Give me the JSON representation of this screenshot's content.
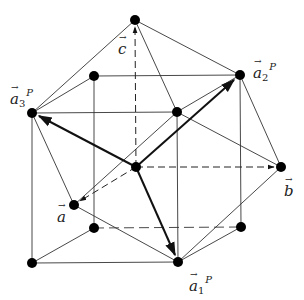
{
  "diagram": {
    "type": "crystal-lattice-vectors",
    "colors": {
      "line": "#333333",
      "point": "#000000",
      "background": "#ffffff"
    },
    "labels": {
      "c": {
        "base": "c",
        "sub": "",
        "sup": ""
      },
      "a": {
        "base": "a",
        "sub": "",
        "sup": ""
      },
      "b": {
        "base": "b",
        "sub": "",
        "sup": ""
      },
      "a1P": {
        "base": "a",
        "sub": "1",
        "sup": "P"
      },
      "a2P": {
        "base": "a",
        "sub": "2",
        "sup": "P"
      },
      "a3P": {
        "base": "a",
        "sub": "3",
        "sup": "P"
      }
    },
    "points": [
      {
        "id": "apex-top",
        "x": 135,
        "y": 20
      },
      {
        "id": "a3P",
        "x": 32,
        "y": 113
      },
      {
        "id": "back-top-left",
        "x": 94,
        "y": 76
      },
      {
        "id": "a2P",
        "x": 240,
        "y": 75
      },
      {
        "id": "front-top-right",
        "x": 177,
        "y": 112
      },
      {
        "id": "center",
        "x": 136,
        "y": 167
      },
      {
        "id": "a-tip",
        "x": 74,
        "y": 205
      },
      {
        "id": "b-tip",
        "x": 281,
        "y": 167
      },
      {
        "id": "back-bottom-left",
        "x": 94,
        "y": 228
      },
      {
        "id": "back-bottom-right",
        "x": 241,
        "y": 227
      },
      {
        "id": "front-bottom-left",
        "x": 32,
        "y": 263
      },
      {
        "id": "a1P",
        "x": 178,
        "y": 262
      }
    ]
  }
}
